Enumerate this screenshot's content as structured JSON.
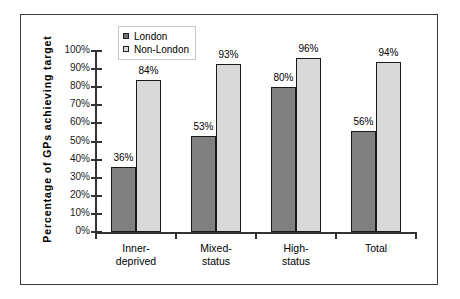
{
  "chart_data": {
    "type": "bar",
    "title": "",
    "xlabel": "",
    "ylabel": "Percentage  of  GPs  achieving  target",
    "categories": [
      "Inner-\ndeprived",
      "Mixed-\nstatus",
      "High-\nstatus",
      "Total"
    ],
    "category_lines": [
      [
        "Inner-",
        "deprived"
      ],
      [
        "Mixed-",
        "status"
      ],
      [
        "High-",
        "status"
      ],
      [
        "Total",
        ""
      ]
    ],
    "series": [
      {
        "name": "London",
        "color": "#808080",
        "values": [
          36,
          53,
          80,
          56
        ],
        "labels": [
          "36%",
          "53%",
          "80%",
          "56%"
        ]
      },
      {
        "name": "Non-London",
        "color": "#D9D9D9",
        "values": [
          84,
          93,
          96,
          94
        ],
        "labels": [
          "84%",
          "93%",
          "96%",
          "94%"
        ]
      }
    ],
    "ylim": [
      0,
      100
    ],
    "ytick_values": [
      0,
      10,
      20,
      30,
      40,
      50,
      60,
      70,
      80,
      90,
      100
    ],
    "ytick_labels": [
      "0%",
      "10%",
      "20%",
      "30%",
      "40%",
      "50%",
      "60%",
      "70%",
      "80%",
      "90%",
      "100%"
    ],
    "grid": false,
    "legend_position": "top-center",
    "legend_entries": [
      "London",
      "Non-London"
    ]
  },
  "legend": {
    "items": [
      {
        "label": "London",
        "swatch": "dark-gray-square"
      },
      {
        "label": "Non-London",
        "swatch": "light-gray-square"
      }
    ]
  },
  "axes": {
    "y_title": "Percentage  of  GPs  achieving  target"
  }
}
